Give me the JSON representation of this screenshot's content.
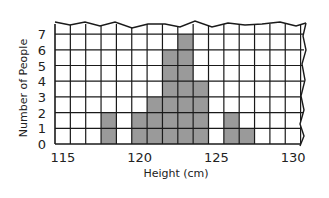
{
  "chart_data": {
    "type": "bar",
    "title": "",
    "xlabel": "Height (cm)",
    "ylabel": "Number of People",
    "categories": [
      115,
      116,
      117,
      118,
      119,
      120,
      121,
      122,
      123,
      124,
      125,
      126,
      127,
      128,
      129,
      130
    ],
    "values": [
      0,
      0,
      0,
      2,
      0,
      2,
      3,
      6,
      7,
      4,
      0,
      2,
      1,
      0,
      0,
      0
    ],
    "x_tick_labels": [
      "115",
      "120",
      "125",
      "130"
    ],
    "x_tick_values": [
      115,
      120,
      125,
      130
    ],
    "y_tick_labels": [
      "0",
      "1",
      "2",
      "3",
      "4",
      "5",
      "6",
      "7"
    ],
    "ylim": [
      0,
      7.4
    ],
    "xlim": [
      115,
      131.3
    ],
    "grid": true,
    "legend": null,
    "bar_color": "#9a9a9a",
    "grid_color": "#1a1a1a"
  }
}
